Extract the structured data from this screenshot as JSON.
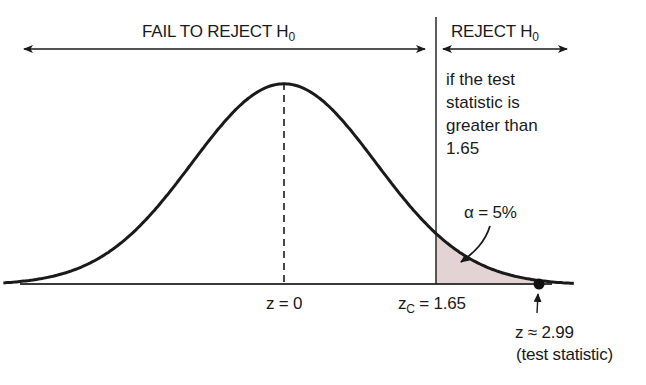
{
  "chart_data": {
    "type": "area",
    "title": "",
    "xlabel": "z",
    "ylabel": "",
    "x_range": [
      -3.05,
      3.15
    ],
    "grid": false,
    "legend": null,
    "curve": "standard normal density",
    "mean_marker": {
      "z": 0,
      "label": "z = 0",
      "style": "dashed"
    },
    "critical_value": {
      "z": 1.65,
      "label_main": "z",
      "label_sub": "C",
      "label_rest": " = 1.65"
    },
    "shaded_region": {
      "from": 1.65,
      "to": 3.15,
      "label": "α = 5%",
      "alpha": 0.05,
      "color": "#e3d3d5"
    },
    "test_statistic": {
      "z": 2.99,
      "label": "z ≈ 2.99",
      "note": "(test statistic)"
    },
    "regions": [
      {
        "name": "FAIL TO REJECT H",
        "sub": "0",
        "from": -3.05,
        "to": 1.65
      },
      {
        "name": "REJECT H",
        "sub": "0",
        "from": 1.65,
        "to": 3.15
      }
    ],
    "rule_text": [
      "if the test",
      "statistic is",
      "greater than",
      "1.65"
    ]
  },
  "labels": {
    "fail_region": "FAIL TO REJECT H",
    "fail_region_sub": "0",
    "reject_region": "REJECT H",
    "reject_region_sub": "0",
    "rule_line1": "if the test",
    "rule_line2": "statistic is",
    "rule_line3": "greater than",
    "rule_line4": "1.65",
    "alpha": "α = 5%",
    "mean": "z = 0",
    "crit_main": "z",
    "crit_sub": "C",
    "crit_rest": " = 1.65",
    "test_stat_value": "z ≈ 2.99",
    "test_stat_note": "(test statistic)"
  },
  "colors": {
    "ink": "#1a1a1a",
    "shade": "#e3d3d5"
  }
}
